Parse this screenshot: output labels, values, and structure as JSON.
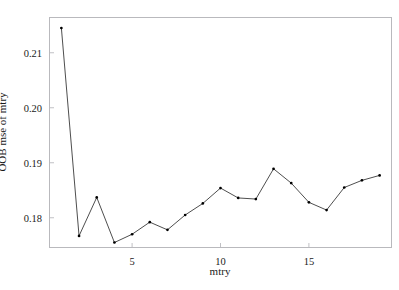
{
  "figure": {
    "top_clipped_text": "",
    "background_color": "#ffffff",
    "frame_color": "#b9b9bd",
    "line_color": "#3a3a3a",
    "point_color": "#000000"
  },
  "axes": {
    "x_title": "mtry",
    "y_title": "OOB mse of mtry",
    "x_ticks": [
      "5",
      "10",
      "15"
    ],
    "y_ticks": [
      "0.18",
      "0.19",
      "0.20",
      "0.21"
    ]
  },
  "chart_data": {
    "type": "line",
    "title": "",
    "xlabel": "mtry",
    "ylabel": "OOB mse of mtry",
    "xlim": [
      0.3,
      19.7
    ],
    "ylim": [
      0.1745,
      0.2165
    ],
    "xticks": [
      5,
      10,
      15
    ],
    "yticks": [
      0.18,
      0.19,
      0.2,
      0.21
    ],
    "grid": false,
    "legend": "none",
    "markers": "filled-dot",
    "x": [
      1,
      2,
      3,
      4,
      5,
      6,
      7,
      8,
      9,
      10,
      11,
      12,
      13,
      14,
      15,
      16,
      17,
      18,
      19
    ],
    "y": [
      0.2145,
      0.1767,
      0.1837,
      0.1755,
      0.177,
      0.1792,
      0.1778,
      0.1805,
      0.1826,
      0.1854,
      0.1836,
      0.1834,
      0.1889,
      0.1863,
      0.1828,
      0.1814,
      0.1855,
      0.1868,
      0.1877
    ],
    "series": [
      {
        "name": "OOB mse of mtry",
        "values": [
          0.2145,
          0.1767,
          0.1837,
          0.1755,
          0.177,
          0.1792,
          0.1778,
          0.1805,
          0.1826,
          0.1854,
          0.1836,
          0.1834,
          0.1889,
          0.1863,
          0.1828,
          0.1814,
          0.1855,
          0.1868,
          0.1877
        ]
      }
    ]
  }
}
